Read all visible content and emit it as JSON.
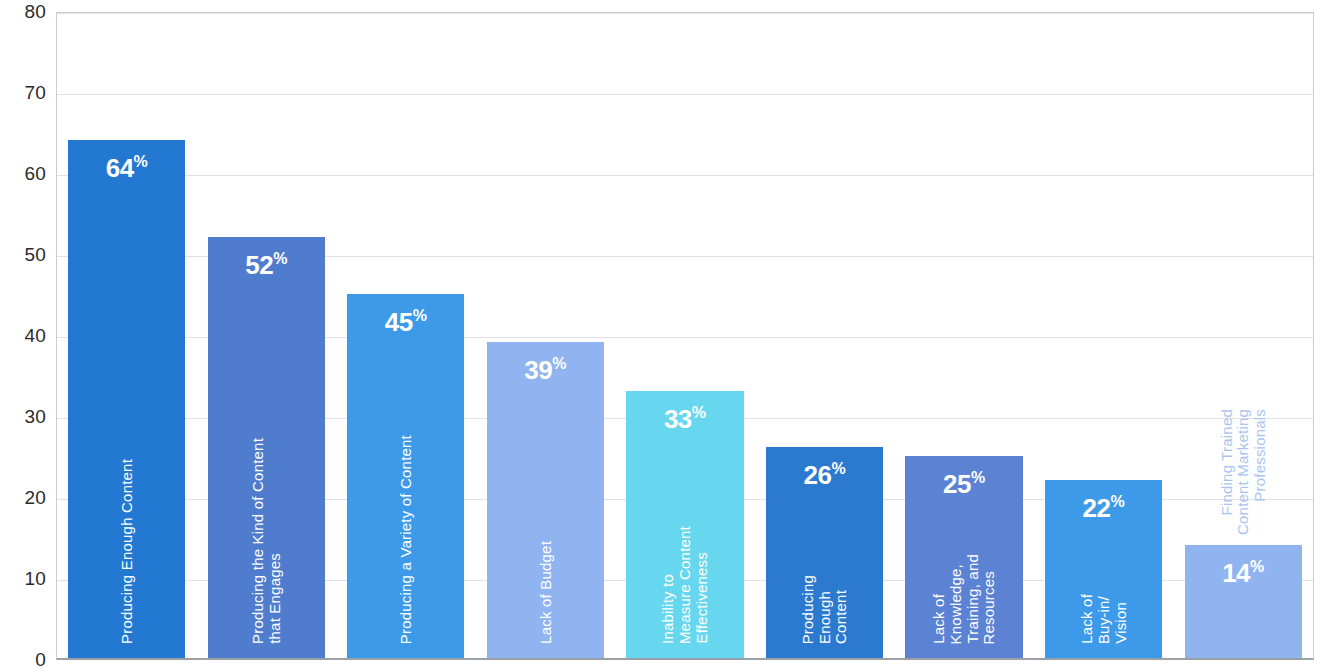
{
  "chart_data": {
    "type": "bar",
    "title": "",
    "subtitle": "",
    "xlabel": "",
    "ylabel": "",
    "ylim": [
      0,
      80
    ],
    "grid": true,
    "legend": "none",
    "value_suffix": "%",
    "y_ticks": [
      "80",
      "70",
      "60",
      "50",
      "40",
      "30",
      "20",
      "10",
      "0"
    ],
    "y_tick_values": [
      80,
      70,
      60,
      50,
      40,
      30,
      20,
      10,
      0
    ],
    "categories": [
      "Producing Enough Content",
      "Producing the Kind of Content that Engages",
      "Producing a Variety of Content",
      "Lack of Budget",
      "Inability to Measure Content Effectiveness",
      "Producing Enough Content",
      "Lack of Knowledge, Training, and Resources",
      "Lack of Buy-in/ Vision",
      "Finding Trained Content Marketing Professionals"
    ],
    "values": [
      64,
      52,
      45,
      39,
      33,
      26,
      25,
      22,
      14
    ],
    "colors": [
      "#2378d2",
      "#4f7ccd",
      "#3d9ae8",
      "#8fb4ef",
      "#67d7ef",
      "#2b7ad0",
      "#5c82d4",
      "#3d9ae8",
      "#8fb4ef"
    ],
    "bars": [
      {
        "value": 64,
        "value_text": "64",
        "suffix": "%",
        "color": "#2378d2",
        "label_lines": [
          "Producing Enough Content"
        ],
        "label_position": "inside"
      },
      {
        "value": 52,
        "value_text": "52",
        "suffix": "%",
        "color": "#4f7ccd",
        "label_lines": [
          "Producing the Kind of Content",
          "that Engages"
        ],
        "label_position": "inside"
      },
      {
        "value": 45,
        "value_text": "45",
        "suffix": "%",
        "color": "#3d9ae8",
        "label_lines": [
          "Producing a Variety of Content"
        ],
        "label_position": "inside"
      },
      {
        "value": 39,
        "value_text": "39",
        "suffix": "%",
        "color": "#8fb4ef",
        "label_lines": [
          "Lack of Budget"
        ],
        "label_position": "inside"
      },
      {
        "value": 33,
        "value_text": "33",
        "suffix": "%",
        "color": "#67d7ef",
        "label_lines": [
          "Inability to",
          "Measure Content",
          "Effectiveness"
        ],
        "label_position": "inside"
      },
      {
        "value": 26,
        "value_text": "26",
        "suffix": "%",
        "color": "#2b7ad0",
        "label_lines": [
          "Producing",
          "Enough",
          "Content"
        ],
        "label_position": "inside"
      },
      {
        "value": 25,
        "value_text": "25",
        "suffix": "%",
        "color": "#5c82d4",
        "label_lines": [
          "Lack of",
          "Knowledge,",
          "Training, and",
          "Resources"
        ],
        "label_position": "inside"
      },
      {
        "value": 22,
        "value_text": "22",
        "suffix": "%",
        "color": "#3d9ae8",
        "label_lines": [
          "Lack of",
          "Buy-in/",
          "Vision"
        ],
        "label_position": "inside"
      },
      {
        "value": 14,
        "value_text": "14",
        "suffix": "%",
        "color": "#8fb4ef",
        "label_lines": [
          "Finding Trained",
          "Content Marketing",
          "Professionals"
        ],
        "label_position": "outside"
      }
    ]
  },
  "style": {
    "plot_background": "#ffffff",
    "gridline_color": "#dfe2e6",
    "axis_border_color": "#c9cdd2",
    "tick_text_color": "#2b2b2b",
    "inside_label_color": "#ffffff",
    "outside_label_color": "#a9c4f2"
  }
}
